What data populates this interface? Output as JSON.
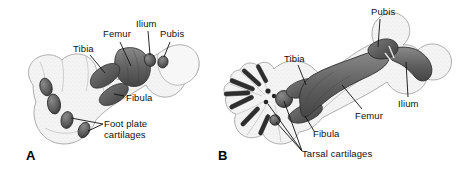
{
  "figure": {
    "type": "anatomical-illustration",
    "background_color": "#ffffff",
    "ink_color": "#1a1a1a",
    "cartilage_fill": "#6e6e6e",
    "soft_tissue_fill": "#f2f2f2",
    "soft_tissue_stroke": "#9a9a9a"
  },
  "panels": [
    {
      "id": "A",
      "letter": "A",
      "letter_pos": {
        "x": 26,
        "y": 148
      },
      "labels": [
        {
          "name": "tibia",
          "text": "Tibia",
          "x": 73,
          "y": 44
        },
        {
          "name": "femur",
          "text": "Femur",
          "x": 103,
          "y": 29
        },
        {
          "name": "ilium",
          "text": "Ilium",
          "x": 136,
          "y": 19
        },
        {
          "name": "pubis",
          "text": "Pubis",
          "x": 160,
          "y": 29
        },
        {
          "name": "fibula",
          "text": "Fibula",
          "x": 126,
          "y": 93
        },
        {
          "name": "foot-plate-cartilages",
          "text": "Foot plate\ncartilages",
          "x": 104,
          "y": 119
        }
      ]
    },
    {
      "id": "B",
      "letter": "B",
      "letter_pos": {
        "x": 218,
        "y": 148
      },
      "labels": [
        {
          "name": "pubis",
          "text": "Pubis",
          "x": 371,
          "y": 7
        },
        {
          "name": "tibia",
          "text": "Tibia",
          "x": 284,
          "y": 54
        },
        {
          "name": "ilium",
          "text": "Ilium",
          "x": 398,
          "y": 99
        },
        {
          "name": "femur",
          "text": "Femur",
          "x": 355,
          "y": 111
        },
        {
          "name": "fibula",
          "text": "Fibula",
          "x": 313,
          "y": 129
        },
        {
          "name": "tarsal-cartilages",
          "text": "Tarsal cartilages",
          "x": 302,
          "y": 149
        }
      ]
    }
  ]
}
